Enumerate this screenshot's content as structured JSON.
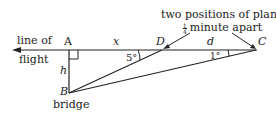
{
  "labels": {
    "line_of_flight_1": "line of",
    "line_of_flight_2": "flight",
    "A": "A",
    "x": "x",
    "D": "D",
    "d": "d",
    "C": "C",
    "h": "h",
    "B": "B",
    "bridge": "bridge",
    "angle_D": "5°",
    "angle_C": "1°",
    "caption_line1": "two positions of plane,",
    "caption_frac_num": "1",
    "caption_frac_den": "4",
    "caption_line2_rest": "minute apart"
  }
}
